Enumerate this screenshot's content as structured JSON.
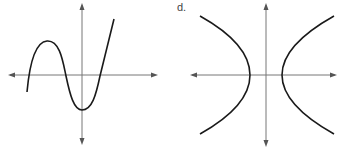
{
  "panels": [
    {
      "label": "",
      "description": "graph of a cubic-like function: rises to a local maximum, falls to a local minimum on the y-axis below origin, then rises steeply; three x-intercepts",
      "axis_color": "#777777",
      "curve_color": "#1a1a1a"
    },
    {
      "label": "d.",
      "description": "graph of a horizontal hyperbola with two branches opening left and right, vertices on the x-axis on either side of the origin",
      "axis_color": "#777777",
      "curve_color": "#1a1a1a"
    }
  ]
}
